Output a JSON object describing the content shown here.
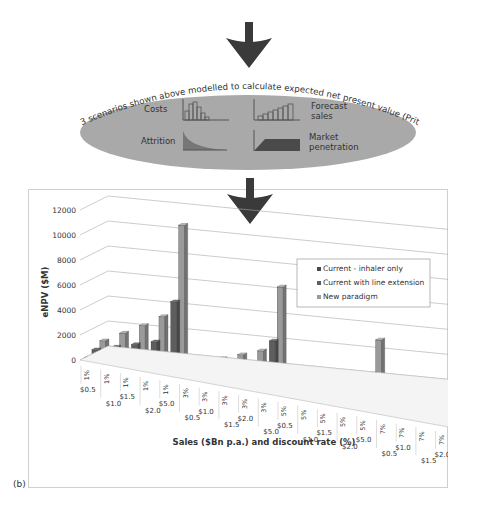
{
  "flow": {
    "ellipse_caption": "3 scenarios shown above modelled to calculate expected net present value (Pritchard 2015)",
    "items": [
      {
        "label": "Costs",
        "icon": "bar-chart-decreasing-icon"
      },
      {
        "label_line1": "Forecast",
        "label_line2": "sales",
        "icon": "bar-chart-increasing-icon"
      },
      {
        "label": "Attrition",
        "icon": "decay-curve-icon"
      },
      {
        "label_line1": "Market",
        "label_line2": "penetration",
        "icon": "ramp-plateau-icon"
      }
    ]
  },
  "panel_label": "(b)",
  "colors": {
    "inhaler": "#4a4a4a",
    "line_extension": "#5e5e5e",
    "new_paradigm": "#9a9a9a",
    "ellipse": "#a9a9a9",
    "arrow": "#3a3a3a"
  },
  "chart_data": {
    "type": "bar",
    "subtype": "3d-clustered-column",
    "title": "",
    "ylabel": "eNPV ($M)",
    "xlabel": "Sales ($Bn p.a.) and discount rate (%)",
    "ylim": [
      0,
      12000
    ],
    "yticks": [
      "0",
      "2000",
      "4000",
      "6000",
      "8000",
      "10000",
      "12000"
    ],
    "grid": true,
    "legend_position": "upper-right",
    "categories": [
      "$0.5 1%",
      "$1.0 1%",
      "$1.5 1%",
      "$2.0 1%",
      "$5.0 1%",
      "$0.5 3%",
      "$1.0 3%",
      "$1.5 3%",
      "$2.0 3%",
      "$5.0 3%",
      "$0.5 5%",
      "$1.0 5%",
      "$1.5 5%",
      "$2.0 5%",
      "$5.0 5%",
      "$0.5 7%",
      "$1.0 7%",
      "$1.5 7%",
      "$2.0 7%",
      "$5.0 7%"
    ],
    "sales_labels": [
      "$0.5",
      "$1.0",
      "$1.5",
      "$2.0",
      "$5.0"
    ],
    "rate_labels": [
      "1%",
      "3%",
      "5%",
      "7%"
    ],
    "series": [
      {
        "name": "Current - inhaler only",
        "values": [
          100,
          200,
          300,
          400,
          1500,
          50,
          150,
          200,
          300,
          1000,
          30,
          80,
          120,
          180,
          600,
          10,
          40,
          70,
          100,
          350
        ]
      },
      {
        "name": "Current with line extension",
        "values": [
          500,
          1000,
          1500,
          2000,
          5500,
          300,
          700,
          1000,
          1400,
          3800,
          150,
          400,
          650,
          900,
          2600,
          80,
          220,
          380,
          520,
          1600
        ]
      },
      {
        "name": "New paradigm",
        "values": [
          900,
          1800,
          2700,
          3700,
          11300,
          500,
          1200,
          1800,
          2400,
          7800,
          300,
          700,
          1100,
          1500,
          5000,
          150,
          400,
          650,
          850,
          2900
        ]
      }
    ]
  }
}
